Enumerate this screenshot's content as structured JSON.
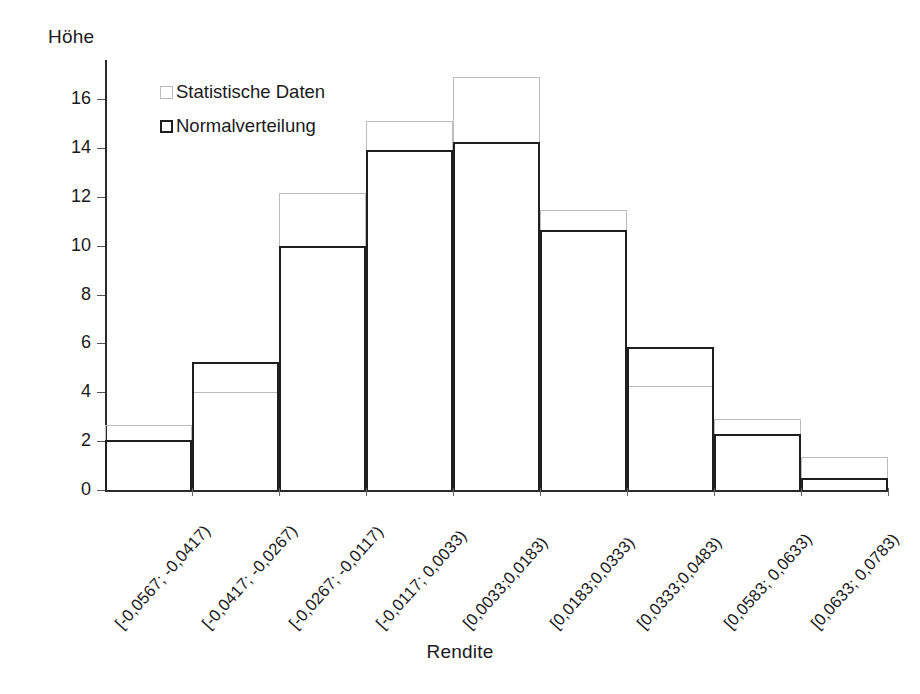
{
  "chart_data": {
    "type": "bar",
    "title": "",
    "subtitle": "",
    "xlabel": "Rendite",
    "ylabel": "Höhe",
    "grid": false,
    "legend_position": "top-left",
    "ylim": [
      0,
      17.6
    ],
    "yticks": [
      0,
      2,
      4,
      6,
      8,
      10,
      12,
      14,
      16
    ],
    "ytick_labels": [
      "0",
      "2",
      "4",
      "6",
      "8",
      "10",
      "12",
      "14",
      "16"
    ],
    "categories": [
      "[-0,0567; -0,0417)",
      "[-0,0417; -0,0267)",
      "[-0,0267; -0,0117)",
      "[-0,0117; 0,0033)",
      "[0,0033;0,0183)",
      "[0,0183;0,0333)",
      "[0,0333;0,0483)",
      "[0,0583; 0,0633)",
      "[0,0633; 0,0783)"
    ],
    "series": [
      {
        "name": "Statistische Daten",
        "color": "#bcbcbc",
        "values": [
          2.65,
          4.0,
          12.15,
          15.1,
          16.9,
          11.45,
          4.25,
          2.9,
          1.35
        ]
      },
      {
        "name": "Normalverteilung",
        "color": "#1f1f1f",
        "values": [
          2.05,
          5.25,
          10.0,
          13.9,
          14.25,
          10.65,
          5.85,
          2.3,
          0.5
        ]
      }
    ]
  },
  "legend": {
    "items": [
      {
        "label": "Statistische Daten"
      },
      {
        "label": "Normalverteilung"
      }
    ]
  }
}
